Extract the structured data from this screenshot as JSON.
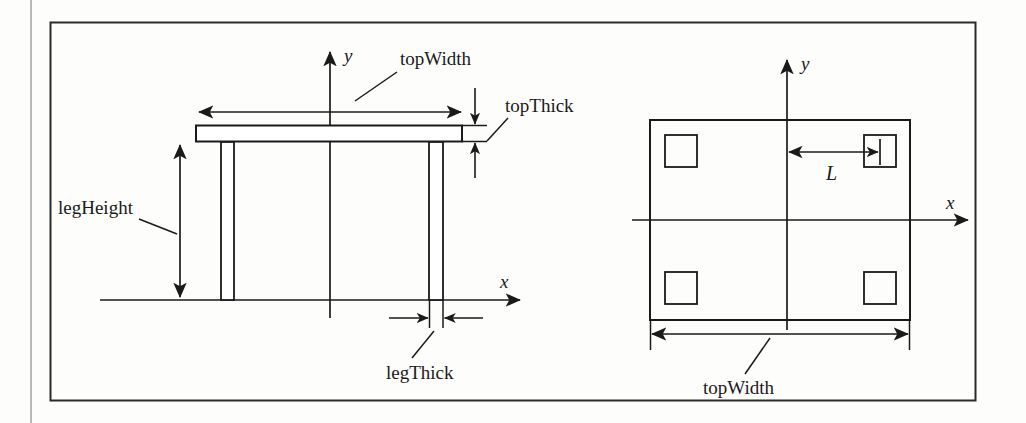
{
  "figure": {
    "kind": "engineering-dimension-diagram",
    "views": [
      "side elevation",
      "top plan"
    ],
    "colors": {
      "ink": "#1a1a1a",
      "paper": "#fdfdfc",
      "border": "#2b2b2b"
    }
  },
  "side_view": {
    "axis_x_label": "x",
    "axis_y_label": "y",
    "labels": {
      "top_width": "topWidth",
      "top_thick": "topThick",
      "leg_height": "legHeight",
      "leg_thick": "legThick"
    }
  },
  "top_view": {
    "axis_x_label": "x",
    "axis_y_label": "y",
    "labels": {
      "leg_offset": "L",
      "top_width": "topWidth"
    }
  }
}
